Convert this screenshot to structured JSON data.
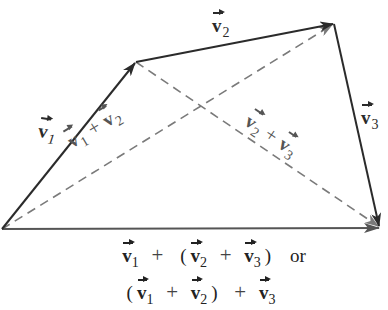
{
  "diagram": {
    "type": "vector-addition-associativity",
    "points": {
      "A": [
        2,
        229
      ],
      "B": [
        136,
        62
      ],
      "C": [
        334,
        24
      ],
      "D": [
        380,
        227
      ]
    },
    "solid_vectors": [
      {
        "id": "v1",
        "from": "A",
        "to": "B",
        "label_base": "v",
        "label_sub": "1"
      },
      {
        "id": "v2",
        "from": "B",
        "to": "C",
        "label_base": "v",
        "label_sub": "2"
      },
      {
        "id": "v3",
        "from": "C",
        "to": "D",
        "label_base": "v",
        "label_sub": "3"
      },
      {
        "id": "sum",
        "from": "A",
        "to": "D",
        "label_base": "",
        "label_sub": ""
      }
    ],
    "dashed_vectors": [
      {
        "id": "v1_plus_v2",
        "from": "A",
        "to": "C",
        "label": [
          "v",
          "1",
          "+",
          "v",
          "2"
        ]
      },
      {
        "id": "v2_plus_v3",
        "from": "B",
        "to": "D",
        "label": [
          "v",
          "2",
          "+",
          "v",
          "3"
        ]
      }
    ],
    "colors": {
      "solid_stroke": "#2b2b2b",
      "sum_stroke": "#555555",
      "dashed_stroke": "#7a7a7a",
      "background": "#ffffff"
    }
  },
  "labels": {
    "v1": {
      "base": "v",
      "sub": "1"
    },
    "v2": {
      "base": "v",
      "sub": "2"
    },
    "v3": {
      "base": "v",
      "sub": "3"
    },
    "v1_plus_v2": {
      "a": "v",
      "a_sub": "1",
      "op": "+",
      "b": "v",
      "b_sub": "2"
    },
    "v2_plus_v3": {
      "a": "v",
      "a_sub": "2",
      "op": "+",
      "b": "v",
      "b_sub": "3"
    }
  },
  "caption": {
    "line1": {
      "t1": "v",
      "t1_sub": "1",
      "op1": "+",
      "open": "(",
      "t2": "v",
      "t2_sub": "2",
      "op2": "+",
      "t3": "v",
      "t3_sub": "3",
      "close": ")",
      "or": "or"
    },
    "line2": {
      "open": "(",
      "t1": "v",
      "t1_sub": "1",
      "op1": "+",
      "t2": "v",
      "t2_sub": "2",
      "close": ")",
      "op2": "+",
      "t3": "v",
      "t3_sub": "3"
    }
  }
}
